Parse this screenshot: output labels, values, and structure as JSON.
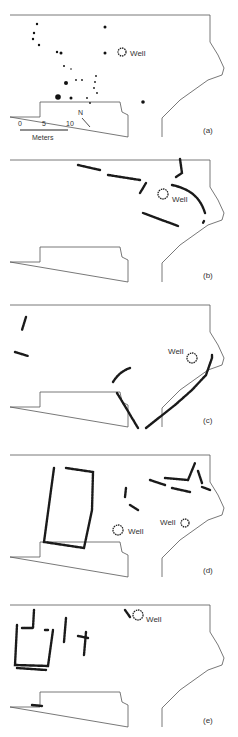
{
  "figure": {
    "panels": [
      {
        "id": "a",
        "label": "(a)",
        "top": 0,
        "well_label": "Well",
        "well": {
          "x": 122,
          "y": 52,
          "r": 4,
          "label_x": 130,
          "label_y": 56
        },
        "points": [
          {
            "x": 37,
            "y": 24,
            "r": 1.2
          },
          {
            "x": 34,
            "y": 33,
            "r": 1.2
          },
          {
            "x": 33,
            "y": 39,
            "r": 1.2
          },
          {
            "x": 39,
            "y": 45,
            "r": 1.2
          },
          {
            "x": 57,
            "y": 52,
            "r": 1.2
          },
          {
            "x": 61,
            "y": 53,
            "r": 1.5
          },
          {
            "x": 105,
            "y": 27,
            "r": 1.5
          },
          {
            "x": 105,
            "y": 53,
            "r": 1.5
          },
          {
            "x": 64,
            "y": 66,
            "r": 1
          },
          {
            "x": 71,
            "y": 69,
            "r": 0.8
          },
          {
            "x": 66,
            "y": 83,
            "r": 2
          },
          {
            "x": 76,
            "y": 80,
            "r": 0.9
          },
          {
            "x": 82,
            "y": 80,
            "r": 0.9
          },
          {
            "x": 96,
            "y": 76,
            "r": 0.9
          },
          {
            "x": 95,
            "y": 82,
            "r": 0.9
          },
          {
            "x": 94,
            "y": 88,
            "r": 0.9
          },
          {
            "x": 97,
            "y": 93,
            "r": 0.9
          },
          {
            "x": 58,
            "y": 97,
            "r": 2.8
          },
          {
            "x": 71,
            "y": 98,
            "r": 1.5
          },
          {
            "x": 87,
            "y": 98,
            "r": 0.9
          },
          {
            "x": 90,
            "y": 103,
            "r": 0.9
          },
          {
            "x": 143,
            "y": 102,
            "r": 1.8
          }
        ],
        "north_label": "N",
        "scale": {
          "ticks": [
            "0",
            "5",
            "10"
          ],
          "unit": "Meters"
        }
      },
      {
        "id": "b",
        "label": "(b)",
        "top": 145,
        "well_label": "Well",
        "well": {
          "x": 163,
          "y": 49,
          "r": 5,
          "label_x": 172,
          "label_y": 57
        },
        "walls": [
          "M78,20 L100,25",
          "M108,30 L140,35",
          "M146,38 L140,48",
          "M180,14 L182,28 L176,32",
          "M172,40 C190,44 200,52 205,68",
          "M204,76 L203,78",
          "M143,68 L178,81"
        ]
      },
      {
        "id": "c",
        "label": "(c)",
        "top": 290,
        "well_label": "Well",
        "well": {
          "x": 192,
          "y": 68,
          "r": 5,
          "label_x": 168,
          "label_y": 64
        },
        "walls": [
          "M26,27 L22,40",
          "M15,62 L28,66",
          "M113,92 C118,84 124,80 130,78",
          "M117,103 C125,116 132,128 138,138",
          "M146,138 L175,115 L192,100 L206,85 L212,68 L212,65"
        ]
      },
      {
        "id": "d",
        "label": "(d)",
        "top": 440,
        "well_label": "Well",
        "wells": [
          {
            "x": 118,
            "y": 90,
            "r": 5,
            "label_x": 128,
            "label_y": 94
          },
          {
            "x": 185,
            "y": 83,
            "r": 4,
            "label_x": 160,
            "label_y": 85
          }
        ],
        "walls": [
          "M54,28 L44,102 L84,108 L92,70 L93,32 L66,28",
          "M126,48 L125,57",
          "M130,65 L138,70",
          "M150,40 L165,45",
          "M165,38 L188,40 L195,23",
          "M172,48 L190,52",
          "M198,31 L202,43",
          "M202,47 L210,50"
        ]
      },
      {
        "id": "e",
        "label": "(e)",
        "top": 590,
        "well_label": "Well",
        "well": {
          "x": 138,
          "y": 25,
          "r": 5,
          "label_x": 146,
          "label_y": 32
        },
        "walls": [
          "M17,35 L15,75 L48,76 L53,40",
          "M17,78 L46,80",
          "M22,38 L33,38 L34,20",
          "M45,40 L48,40",
          "M66,28 L64,52",
          "M78,46 L88,48",
          "M86,42 L84,65",
          "M125,20 L130,27",
          "M32,115 L42,116"
        ]
      }
    ]
  }
}
